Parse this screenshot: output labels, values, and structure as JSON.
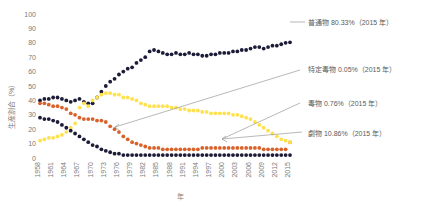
{
  "chart_data": {
    "type": "line",
    "title": "",
    "xlabel": "年",
    "ylabel": "生産割合（%）",
    "ylim": [
      0,
      100
    ],
    "ytick_labels": [
      "100",
      "90",
      "80",
      "70",
      "60",
      "50",
      "40",
      "30",
      "20",
      "10",
      "0"
    ],
    "ytick_values": [
      100,
      90,
      80,
      70,
      60,
      50,
      40,
      30,
      20,
      10,
      0
    ],
    "xlim": [
      1958,
      2015
    ],
    "xtick_labels": [
      "1958",
      "1961",
      "1964",
      "1967",
      "1970",
      "1973",
      "1976",
      "1979",
      "1982",
      "1985",
      "1988",
      "1991",
      "1994",
      "1997",
      "2000",
      "2003",
      "2006",
      "2009",
      "2012",
      "2015"
    ],
    "xtick_values": [
      1958,
      1961,
      1964,
      1967,
      1970,
      1973,
      1976,
      1979,
      1982,
      1985,
      1988,
      1991,
      1994,
      1997,
      2000,
      2003,
      2006,
      2009,
      2012,
      2015
    ],
    "grid": false,
    "legend_position": "right",
    "marker": "filled-circle",
    "x": [
      1958,
      1959,
      1960,
      1961,
      1962,
      1963,
      1964,
      1965,
      1966,
      1967,
      1968,
      1969,
      1970,
      1971,
      1972,
      1973,
      1974,
      1975,
      1976,
      1977,
      1978,
      1979,
      1980,
      1981,
      1982,
      1983,
      1984,
      1985,
      1986,
      1987,
      1988,
      1989,
      1990,
      1991,
      1992,
      1993,
      1994,
      1995,
      1996,
      1997,
      1998,
      1999,
      2000,
      2001,
      2002,
      2003,
      2004,
      2005,
      2006,
      2007,
      2008,
      2009,
      2010,
      2011,
      2012,
      2013,
      2014,
      2015
    ],
    "series": [
      {
        "name": "普通物",
        "color": "#1c1c38",
        "final_value": 80.33,
        "final_label": "普通物 80.33%（2015 年）",
        "values": [
          40,
          41,
          41,
          42,
          42,
          41,
          40,
          39,
          40,
          41,
          39,
          38,
          38,
          42,
          46,
          50,
          53,
          55,
          58,
          60,
          62,
          63,
          66,
          68,
          70,
          74,
          75,
          74,
          73,
          72,
          72,
          73,
          72,
          72,
          73,
          72,
          72,
          71,
          71,
          72,
          72,
          73,
          73,
          73,
          74,
          74,
          75,
          75,
          76,
          77,
          77,
          76,
          77,
          78,
          78,
          79,
          80,
          80.33
        ]
      },
      {
        "name": "劇物",
        "color": "#d9622b",
        "final_value": 10.86,
        "final_label": "劇物 10.86%（2015 年）",
        "values": [
          38,
          38,
          37,
          36,
          36,
          35,
          34,
          31,
          30,
          28,
          27,
          27,
          27,
          26,
          26,
          25,
          22,
          20,
          18,
          15,
          13,
          11,
          10,
          9,
          8,
          7,
          7,
          7,
          6,
          6,
          6,
          6,
          6,
          6,
          6,
          6,
          6,
          7,
          7,
          7,
          7,
          7,
          7,
          7,
          7,
          7,
          7,
          7,
          7,
          7,
          7,
          6,
          6,
          6,
          6,
          6,
          6,
          10.86
        ]
      },
      {
        "name": "特定毒物",
        "color": "#ffe14d",
        "final_value": 0.05,
        "final_label": "特定毒物 0.05%（2015 年）",
        "values": [
          12,
          13,
          14,
          14,
          15,
          16,
          18,
          21,
          24,
          35,
          38,
          36,
          40,
          42,
          44,
          45,
          45,
          44,
          44,
          42,
          42,
          41,
          40,
          38,
          37,
          36,
          36,
          36,
          36,
          36,
          35,
          35,
          34,
          34,
          33,
          33,
          33,
          32,
          32,
          31,
          31,
          31,
          31,
          31,
          30,
          30,
          29,
          28,
          27,
          25,
          23,
          21,
          19,
          17,
          15,
          13,
          12,
          11
        ]
      },
      {
        "name": "毒物",
        "color": "#1c1c38",
        "final_value": 0.76,
        "final_label": "毒物 0.76%（2015 年）",
        "values": [
          28,
          27,
          27,
          26,
          25,
          23,
          21,
          19,
          17,
          15,
          13,
          11,
          9,
          8,
          6,
          5,
          4,
          3,
          3,
          2,
          2,
          2,
          2,
          2,
          2,
          2,
          2,
          2,
          2,
          2,
          2,
          2,
          2,
          2,
          2,
          2,
          2,
          2,
          2,
          2,
          2,
          2,
          2,
          2,
          2,
          2,
          2,
          2,
          2,
          2,
          2,
          2,
          2,
          2,
          2,
          2,
          2,
          2
        ]
      }
    ],
    "annotations": [
      {
        "name": "label-futsubutsu",
        "text": "普通物 80.33%（2015 年）",
        "has_leader": false
      },
      {
        "name": "label-tokutei-dokubutsu",
        "text": "特定毒物 0.05%（2015 年）",
        "has_leader": true
      },
      {
        "name": "label-dokubutsu",
        "text": "毒物 0.76%（2015 年）",
        "has_leader": true
      },
      {
        "name": "label-gekibutsu",
        "text": "劇物 10.86%（2015 年）",
        "has_leader": false
      }
    ]
  }
}
